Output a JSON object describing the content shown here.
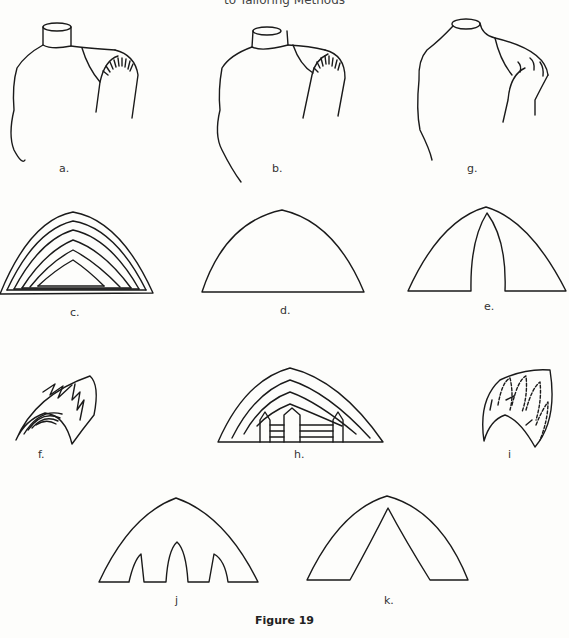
{
  "header": {
    "running_title": "to Tailoring Methods"
  },
  "figure": {
    "caption": "Figure 19",
    "panels": [
      {
        "id": "a",
        "label": "a.",
        "description": "Dress form torso with hatched shoulder pad region"
      },
      {
        "id": "b",
        "label": "b.",
        "description": "Dress form torso with smaller hatched shoulder pad"
      },
      {
        "id": "g",
        "label": "g.",
        "description": "Dress form torso with shaped shoulder pad showing darts"
      },
      {
        "id": "c",
        "label": "c.",
        "description": "Nested layered arch pattern (graduated pad layers)"
      },
      {
        "id": "d",
        "label": "d.",
        "description": "Plain arch shaped pad pattern"
      },
      {
        "id": "e",
        "label": "e.",
        "description": "Arch pad pattern with single center dart"
      },
      {
        "id": "f",
        "label": "f.",
        "description": "Curved pad with layered lines and padding stitch arrows"
      },
      {
        "id": "h",
        "label": "h.",
        "description": "Layered arch pattern with three darts"
      },
      {
        "id": "i",
        "label": "i",
        "description": "Curved pad with dashed padding stitches and xxxx marks"
      },
      {
        "id": "j",
        "label": "j",
        "description": "Arch pad pattern with three darts"
      },
      {
        "id": "k",
        "label": "k.",
        "description": "Arch pad pattern with wide center V dart"
      }
    ]
  }
}
